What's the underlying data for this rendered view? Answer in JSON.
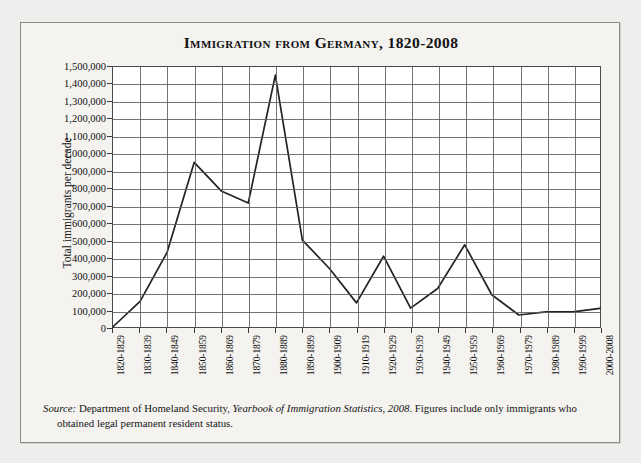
{
  "figure": {
    "title": "Immigration from Germany, 1820-2008",
    "source_prefix": "Source:",
    "source_body_1": " Department of Homeland Security, ",
    "source_italic": "Yearbook of Immigration Statistics, 2008",
    "source_body_2": ". Figures include only immigrants who obtained legal permanent resident status."
  },
  "chart_data": {
    "type": "line",
    "title": "Immigration from Germany, 1820-2008",
    "xlabel": "",
    "ylabel": "Total immigrants per decade",
    "ylim": [
      0,
      1500000
    ],
    "ytick_step": 100000,
    "grid": true,
    "legend": "none",
    "line_color": "#222222",
    "categories": [
      "1820-1829",
      "1830-1839",
      "1840-1849",
      "1850-1859",
      "1860-1869",
      "1870-1879",
      "1880-1889",
      "1890-1899",
      "1900-1909",
      "1910-1919",
      "1920-1929",
      "1930-1939",
      "1940-1949",
      "1950-1959",
      "1960-1969",
      "1970-1979",
      "1980-1989",
      "1990-1999",
      "2000-2008"
    ],
    "values": [
      6761,
      152454,
      434626,
      951667,
      787468,
      718182,
      1452970,
      505152,
      341498,
      143945,
      412202,
      114058,
      226578,
      477765,
      190796,
      74414,
      91961,
      92606,
      111886
    ],
    "ytick_labels": [
      "0",
      "100,000",
      "200,000",
      "300,000",
      "400,000",
      "500,000",
      "600,000",
      "700,000",
      "800,000",
      "900,000",
      "1,000,000",
      "1,100,000",
      "1,200,000",
      "1,300,000",
      "1,400,000",
      "1,500,000"
    ]
  }
}
